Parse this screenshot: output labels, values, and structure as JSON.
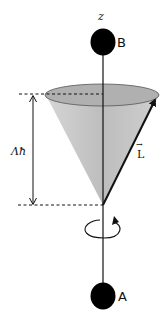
{
  "diagram": {
    "axis_label": "z",
    "top_mass_label": "B",
    "bottom_mass_label": "A",
    "height_label": "Λħ",
    "vector_label": "L",
    "vector_arrow_glyph": "→",
    "colors": {
      "cone_fill": "#c4c4c4",
      "ellipse_fill": "#b3b3b3",
      "line": "#111111",
      "mass": "#000000"
    }
  }
}
